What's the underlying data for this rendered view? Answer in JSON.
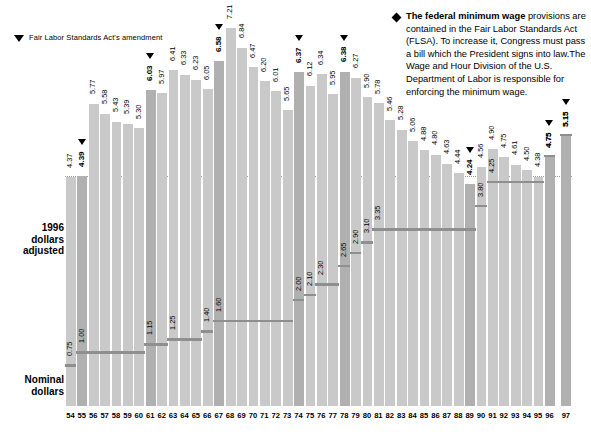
{
  "legend": {
    "marker_icon": "down-triangle-icon",
    "text": "Fair Labor Standards Act's amendment"
  },
  "note": {
    "bullet_icon": "diamond-bullet-icon",
    "lead": "The federal minimum wage",
    "text": " provisions are contained in the Fair Labor Standards Act (FLSA). To increase it, Congress must pass a bill which the President signs into law.The Wage and Hour Division of the U.S. Department of Labor is responsible for enforcing the minimum wage."
  },
  "axis_labels": {
    "real": "1996\ndollars\nadjusted",
    "real_line1": "1996",
    "real_line2": "dollars",
    "real_line3": "adjusted",
    "nominal_line1": "Nominal",
    "nominal_line2": "dollars"
  },
  "colors": {
    "bar": "#c9c9c9",
    "bar_flsa": "#b0b0b0",
    "nominal_step": "#8f8f8f",
    "text": "#000000",
    "background": "#ffffff"
  },
  "chart_data": {
    "type": "bar",
    "title": "",
    "xlabel": "",
    "ylabel": "",
    "ylim": [
      0,
      7.6
    ],
    "grid": false,
    "legend_position": "top-left",
    "categories": [
      "54",
      "55",
      "56",
      "57",
      "58",
      "59",
      "60",
      "61",
      "62",
      "63",
      "64",
      "65",
      "66",
      "67",
      "68",
      "69",
      "70",
      "71",
      "72",
      "73",
      "74",
      "75",
      "76",
      "77",
      "78",
      "79",
      "80",
      "81",
      "82",
      "83",
      "84",
      "85",
      "86",
      "87",
      "88",
      "89",
      "90",
      "91",
      "92",
      "93",
      "94",
      "95",
      "96",
      "97"
    ],
    "series": [
      {
        "name": "1996 dollars adjusted",
        "values": [
          4.37,
          4.39,
          5.77,
          5.58,
          5.43,
          5.39,
          5.3,
          6.03,
          5.97,
          6.41,
          6.33,
          6.23,
          6.05,
          6.58,
          7.21,
          6.84,
          6.47,
          6.2,
          6.01,
          5.65,
          6.37,
          6.12,
          6.34,
          5.95,
          6.38,
          6.27,
          5.9,
          5.78,
          5.46,
          5.28,
          5.06,
          4.88,
          4.8,
          4.63,
          4.44,
          4.24,
          4.56,
          4.9,
          4.75,
          4.61,
          4.5,
          4.38,
          4.75,
          5.15
        ]
      },
      {
        "name": "Nominal dollars",
        "values": [
          0.75,
          1.0,
          1.0,
          1.0,
          1.0,
          1.0,
          1.0,
          1.15,
          1.15,
          1.25,
          1.25,
          1.25,
          1.4,
          1.6,
          1.6,
          1.6,
          1.6,
          1.6,
          1.6,
          1.6,
          2.0,
          2.1,
          2.3,
          2.3,
          2.65,
          2.9,
          3.1,
          3.35,
          3.35,
          3.35,
          3.35,
          3.35,
          3.35,
          3.35,
          3.35,
          3.35,
          3.8,
          4.25,
          4.25,
          4.25,
          4.25,
          4.25,
          4.75,
          5.15
        ]
      }
    ],
    "nominal_labeled_points": [
      {
        "year": "54",
        "value": "0.75"
      },
      {
        "year": "55",
        "value": "1.00"
      },
      {
        "year": "61",
        "value": "1.15"
      },
      {
        "year": "63",
        "value": "1.25"
      },
      {
        "year": "66",
        "value": "1.40"
      },
      {
        "year": "67",
        "value": "1.60"
      },
      {
        "year": "74",
        "value": "2.00"
      },
      {
        "year": "75",
        "value": "2.10"
      },
      {
        "year": "76",
        "value": "2.30"
      },
      {
        "year": "78",
        "value": "2.65"
      },
      {
        "year": "79",
        "value": "2.90"
      },
      {
        "year": "80",
        "value": "3.10"
      },
      {
        "year": "81",
        "value": "3.35"
      },
      {
        "year": "90",
        "value": "3.80"
      },
      {
        "year": "91",
        "value": "4.25"
      },
      {
        "year": "96",
        "value": "4.75"
      },
      {
        "year": "97",
        "value": "5.15"
      }
    ],
    "flsa_amendment_years": [
      "55",
      "61",
      "67",
      "74",
      "78",
      "89",
      "96",
      "97"
    ],
    "reference_line_value": 4.39
  }
}
